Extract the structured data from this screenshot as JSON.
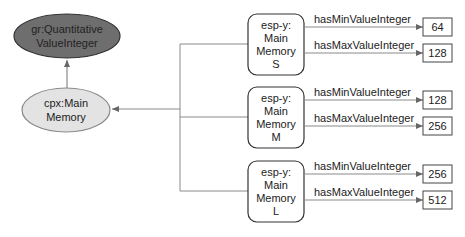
{
  "nodes": {
    "quantitative_value": {
      "line1": "gr:Quantitative",
      "line2": "ValueInteger",
      "fill": "#6e6e6e"
    },
    "main_memory": {
      "line1": "cpx:Main",
      "line2": "Memory",
      "fill": "#e3e3e3"
    }
  },
  "instances": [
    {
      "line1": "esp-y:",
      "line2": "Main",
      "line3": "Memory",
      "line4": "S",
      "min_label": "hasMinValueInteger",
      "min_value": "64",
      "max_label": "hasMaxValueInteger",
      "max_value": "128"
    },
    {
      "line1": "esp-y:",
      "line2": "Main",
      "line3": "Memory",
      "line4": "M",
      "min_label": "hasMinValueInteger",
      "min_value": "128",
      "max_label": "hasMaxValueInteger",
      "max_value": "256"
    },
    {
      "line1": "esp-y:",
      "line2": "Main",
      "line3": "Memory",
      "line4": "L",
      "min_label": "hasMinValueInteger",
      "min_value": "256",
      "max_label": "hasMaxValueInteger",
      "max_value": "512"
    }
  ],
  "colors": {
    "line": "#7a7a7a",
    "border": "#444444",
    "text": "#222222"
  }
}
